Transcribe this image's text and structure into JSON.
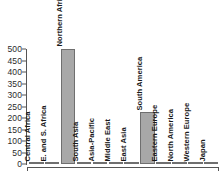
{
  "chart_data": {
    "type": "bar",
    "title": "",
    "xlabel": "",
    "ylabel": "",
    "ylim": [
      0,
      500
    ],
    "y_ticks": [
      0,
      50,
      100,
      150,
      200,
      250,
      300,
      350,
      400,
      450,
      500
    ],
    "grid": false,
    "legend": "none",
    "orientation": "vertical",
    "bar_color": "#a8a8a8",
    "bar_border_color": "#6f6f6f",
    "axis_color": "#555555",
    "background": "#ffffff",
    "label_rotation_deg": 90,
    "categories": [
      "Central Africa",
      "E. and S. Africa",
      "Northern Africa",
      "South Asia",
      "Asia-Pacific",
      "Middle East",
      "East Asia",
      "South America",
      "Eastern Europe",
      "North America",
      "Western Europe",
      "Japan"
    ],
    "values": [
      6,
      7,
      500,
      2,
      1,
      1,
      2,
      224,
      1,
      1,
      1,
      0
    ]
  }
}
